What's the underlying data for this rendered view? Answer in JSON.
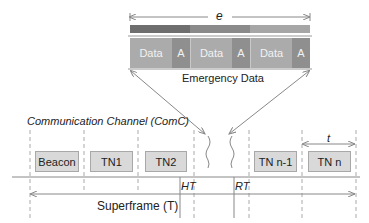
{
  "emergency": {
    "duration_label": "e",
    "caption": "Emergency Data",
    "blocks": [
      {
        "data_label": "Data",
        "ack_label": "A"
      },
      {
        "data_label": "Data",
        "ack_label": "A"
      },
      {
        "data_label": "Data",
        "ack_label": "A"
      }
    ],
    "bar_colors": [
      "#6e6e6e",
      "#8a8a8a",
      "#a6a6a6"
    ],
    "data_color": "#ababab",
    "ack_color": "#8f8f8f"
  },
  "channel": {
    "title": "Communication Channel (ComC)",
    "slots": [
      {
        "label": "Beacon"
      },
      {
        "label": "TN1"
      },
      {
        "label": "TN2"
      },
      {
        "label": "TN n-1"
      },
      {
        "label": "TN n"
      }
    ],
    "slot_duration_label": "t",
    "ht_label": "HT",
    "rt_label": "RT",
    "superframe_label": "Superframe (T)"
  }
}
